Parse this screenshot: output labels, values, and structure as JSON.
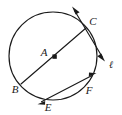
{
  "figure": {
    "type": "circle-geometry-diagram",
    "canvas": {
      "width": 122,
      "height": 115
    },
    "background_color": "#ffffff",
    "stroke_color": "#1a1a1a"
  },
  "circle": {
    "name": "main-circle",
    "center_x": 53,
    "center_y": 56,
    "radius": 44
  },
  "center_point": {
    "name": "center-point-a",
    "label": "A",
    "x": 55,
    "y": 57,
    "label_x": 44,
    "label_y": 53
  },
  "points": [
    {
      "id": "B",
      "label": "B",
      "x": 21,
      "y": 84,
      "label_x": 15,
      "label_y": 90
    },
    {
      "id": "C",
      "label": "C",
      "x": 86,
      "y": 28,
      "label_x": 93,
      "label_y": 22
    },
    {
      "id": "E",
      "label": "E",
      "x": 47,
      "y": 100,
      "label_x": 48,
      "label_y": 108
    },
    {
      "id": "F",
      "label": "F",
      "x": 86,
      "y": 83,
      "label_x": 89,
      "label_y": 91
    }
  ],
  "lines": [
    {
      "id": "diameter-bc",
      "label": "",
      "from": "B",
      "to": "C",
      "x1": 21,
      "y1": 84,
      "x2": 86,
      "y2": 28,
      "arrows": "none"
    },
    {
      "id": "line-l",
      "label": "ℓ",
      "label_x": 111,
      "label_y": 65,
      "x1": 73,
      "y1": 8,
      "x2": 104,
      "y2": 59,
      "arrows": "both"
    },
    {
      "id": "line-ef",
      "label": "",
      "from": "E",
      "to": "F",
      "x1": 39,
      "y1": 103,
      "x2": 95,
      "y2": 74,
      "arrows": "both"
    }
  ],
  "labels": {
    "a": "A",
    "b": "B",
    "c": "C",
    "e": "E",
    "f": "F",
    "l": "ℓ"
  }
}
